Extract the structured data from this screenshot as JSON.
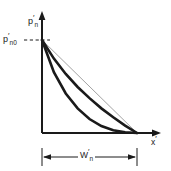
{
  "figure": {
    "background_color": "#ffffff",
    "ink_color": "#1a1a1a",
    "light_ink_color": "#8c8c8c"
  },
  "labels": {
    "y_axis": {
      "base": "p",
      "prime": "′",
      "sub": "n"
    },
    "y_axis_text": "p′n",
    "y_intercept": {
      "base": "p",
      "prime": "′",
      "sub": "n0"
    },
    "y_intercept_text": "p′n0",
    "x_axis": {
      "base": "x",
      "prime": "′",
      "sub": ""
    },
    "x_axis_text": "x′",
    "dimension": {
      "base": "W",
      "prime": "′",
      "sub": "n"
    },
    "dimension_text": "W′n"
  },
  "chart_data": {
    "type": "line",
    "title": "",
    "xlabel": "x′",
    "ylabel": "p′n",
    "xlim": [
      0,
      1
    ],
    "ylim": [
      0,
      1
    ],
    "grid": false,
    "legend": false,
    "annotations": [
      {
        "name": "y-intercept-tick",
        "text": "p′n0",
        "x": 0,
        "y": 1,
        "style": "dashed-leader"
      },
      {
        "name": "width-dimension",
        "text": "W′n",
        "from_x": 0,
        "to_x": 1,
        "style": "double-arrow"
      }
    ],
    "series": [
      {
        "name": "linear-profile",
        "style": "thin-straight",
        "color": "#8c8c8c",
        "width": 0.8,
        "x": [
          0.0,
          0.125,
          0.25,
          0.375,
          0.5,
          0.625,
          0.75,
          0.875,
          1.0
        ],
        "y": [
          1.0,
          0.875,
          0.75,
          0.625,
          0.5,
          0.375,
          0.25,
          0.125,
          0.0
        ]
      },
      {
        "name": "moderate-decay-profile",
        "style": "thick-convex",
        "color": "#1a1a1a",
        "width": 2.6,
        "x": [
          0.0,
          0.125,
          0.25,
          0.375,
          0.5,
          0.625,
          0.75,
          0.875,
          1.0
        ],
        "y": [
          1.0,
          0.8,
          0.635,
          0.495,
          0.375,
          0.265,
          0.17,
          0.08,
          0.0
        ]
      },
      {
        "name": "rapid-decay-profile",
        "style": "thick-convex",
        "color": "#1a1a1a",
        "width": 2.6,
        "x": [
          0.0,
          0.125,
          0.25,
          0.375,
          0.5,
          0.625,
          0.75,
          0.875,
          1.0
        ],
        "y": [
          1.0,
          0.655,
          0.425,
          0.265,
          0.15,
          0.075,
          0.03,
          0.008,
          0.0
        ]
      }
    ],
    "axes": {
      "origin_px": [
        42,
        133
      ],
      "x_end_px": 160,
      "y_top_px": 12,
      "curve_start_px": [
        42,
        40
      ],
      "curve_end_px": [
        137,
        133
      ],
      "arrowheads": [
        "x-positive",
        "y-positive"
      ]
    }
  }
}
